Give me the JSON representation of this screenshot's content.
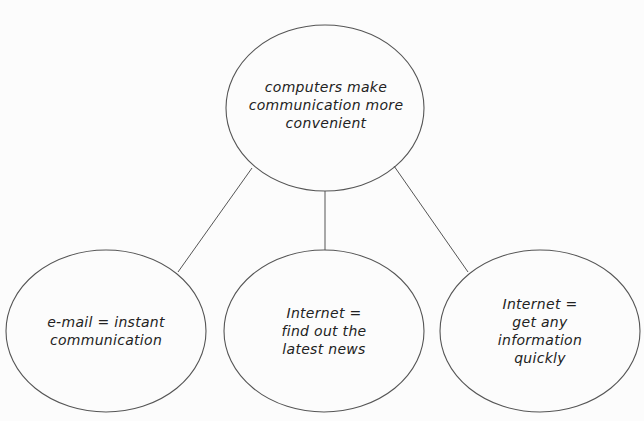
{
  "diagram": {
    "type": "concept-map",
    "colors": {
      "stroke": "#555555",
      "text": "#222222",
      "background": "#fcfcfc"
    },
    "root": {
      "id": "root",
      "text": "computers make\ncommunication more\nconvenient",
      "shape": {
        "cx": 325,
        "cy": 108,
        "rx": 99,
        "ry": 83
      }
    },
    "children": [
      {
        "id": "email",
        "text": "e-mail = instant\ncommunication",
        "shape": {
          "cx": 106,
          "cy": 331,
          "rx": 100,
          "ry": 81
        },
        "edge": {
          "x1": 252,
          "y1": 168,
          "x2": 178,
          "y2": 272
        }
      },
      {
        "id": "news",
        "text": "Internet =\nfind out the\nlatest news",
        "shape": {
          "cx": 324,
          "cy": 331,
          "rx": 100,
          "ry": 81
        },
        "edge": {
          "x1": 325,
          "y1": 191,
          "x2": 325,
          "y2": 250
        }
      },
      {
        "id": "info",
        "text": "Internet =\nget any\ninformation\nquickly",
        "shape": {
          "cx": 540,
          "cy": 331,
          "rx": 100,
          "ry": 81
        },
        "edge": {
          "x1": 394,
          "y1": 166,
          "x2": 468,
          "y2": 272
        }
      }
    ]
  }
}
